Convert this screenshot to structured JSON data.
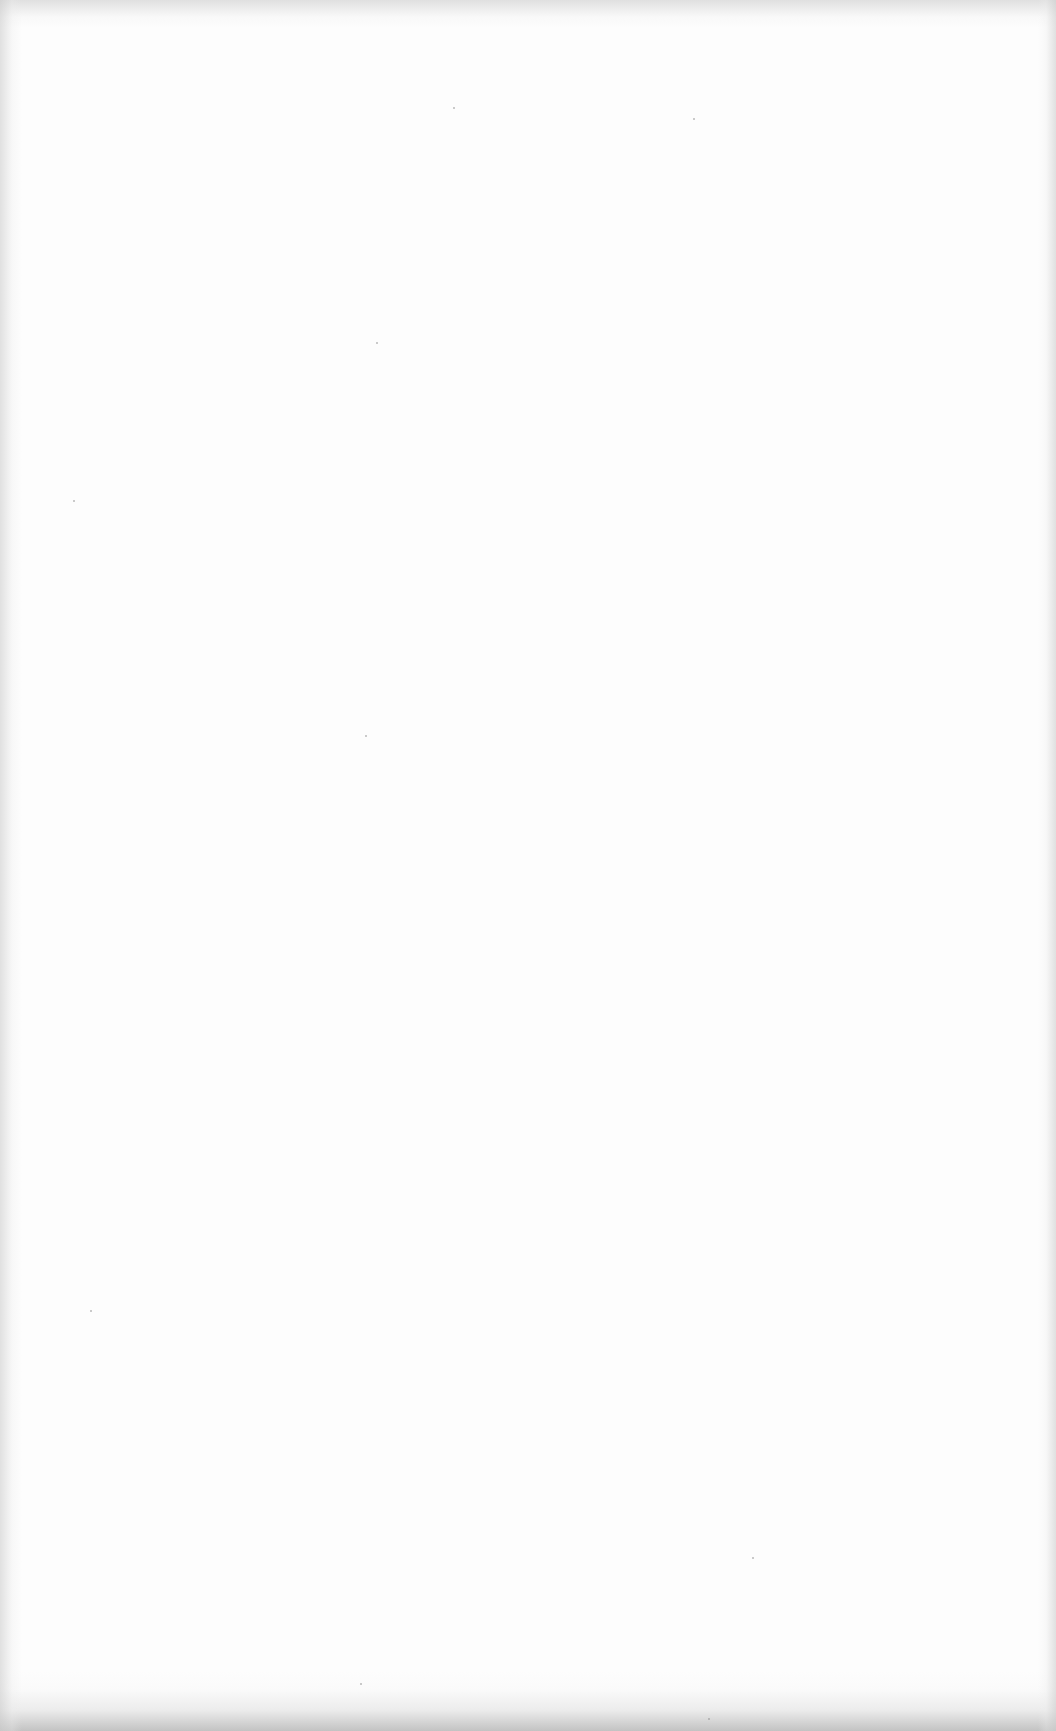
{
  "document": {
    "description": "Blank scanned page",
    "content": ""
  },
  "colors": {
    "paper": "#fdfdfd",
    "edge_shadow": "#c8c8c8"
  },
  "specks": [
    {
      "x": 453,
      "y": 107
    },
    {
      "x": 693,
      "y": 118
    },
    {
      "x": 376,
      "y": 342
    },
    {
      "x": 73,
      "y": 500
    },
    {
      "x": 365,
      "y": 735
    },
    {
      "x": 90,
      "y": 1310
    },
    {
      "x": 752,
      "y": 1557
    },
    {
      "x": 708,
      "y": 1718
    },
    {
      "x": 360,
      "y": 1683
    }
  ]
}
